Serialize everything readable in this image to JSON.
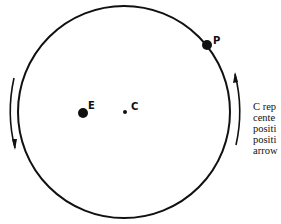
{
  "diagram": {
    "labels": {
      "earth": "E",
      "center": "C",
      "planet": "P"
    },
    "arrows": {
      "left": "down",
      "right": "up"
    },
    "caption_lines": [
      "C rep",
      "cente",
      "positi",
      "positi",
      "arrow"
    ]
  }
}
